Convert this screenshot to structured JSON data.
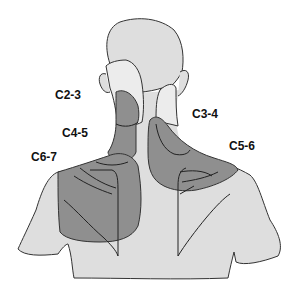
{
  "diagram": {
    "colors": {
      "background": "#ffffff",
      "body_fill": "#dedede",
      "light_region_fill": "#ececec",
      "shaded_region_fill": "#8f8f8f",
      "outline": "#333333"
    },
    "labels": [
      {
        "id": "c2-3",
        "text": "C2-3",
        "x": 55,
        "y": 89
      },
      {
        "id": "c3-4",
        "text": "C3-4",
        "x": 192,
        "y": 108
      },
      {
        "id": "c4-5",
        "text": "C4-5",
        "x": 62,
        "y": 127
      },
      {
        "id": "c5-6",
        "text": "C5-6",
        "x": 229,
        "y": 140
      },
      {
        "id": "c6-7",
        "text": "C6-7",
        "x": 31,
        "y": 151
      }
    ]
  }
}
